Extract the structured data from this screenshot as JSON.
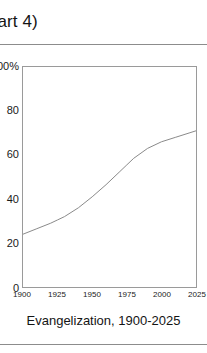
{
  "header": {
    "title_fragment": "Part 4)"
  },
  "figure": {
    "caption": "Evangelization, 1900-2025"
  },
  "chart_data": {
    "type": "line",
    "title": "Evangelization, 1900-2025",
    "xlabel": "",
    "ylabel": "%",
    "xlim": [
      1900,
      2025
    ],
    "ylim": [
      0,
      100
    ],
    "grid": false,
    "legend": null,
    "line_color": "#8a8a8a",
    "x_ticks": [
      "1900",
      "1925",
      "1950",
      "1975",
      "2000",
      "2025"
    ],
    "x_tick_values": [
      1900,
      1925,
      1950,
      1975,
      2000,
      2025
    ],
    "y_ticks": [
      "100%",
      "80",
      "60",
      "40",
      "20",
      "0"
    ],
    "y_tick_values": [
      100,
      80,
      60,
      40,
      20,
      0
    ],
    "series": [
      {
        "name": "Evangelization",
        "x": [
          1900,
          1910,
          1920,
          1925,
          1930,
          1940,
          1950,
          1960,
          1970,
          1975,
          1980,
          1990,
          2000,
          2010,
          2020,
          2025
        ],
        "values": [
          24.0,
          26.5,
          29.0,
          30.5,
          32.0,
          36.0,
          41.0,
          46.5,
          52.5,
          55.5,
          58.5,
          63.0,
          66.0,
          68.0,
          70.0,
          71.0
        ]
      }
    ]
  }
}
